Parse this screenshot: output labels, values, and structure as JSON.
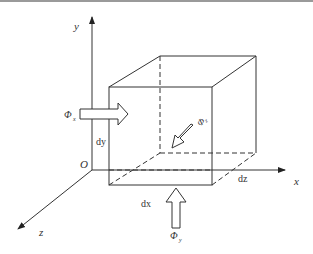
{
  "diagram": {
    "axes": {
      "x_label": "x",
      "y_label": "y",
      "z_label": "z",
      "origin_label": "O"
    },
    "dimensions": {
      "dx": "dx",
      "dy": "dy",
      "dz": "dz"
    },
    "fluxes": {
      "phi_x": {
        "symbol": "Φ",
        "subscript": "x"
      },
      "phi_y": {
        "symbol": "Φ",
        "subscript": "y"
      },
      "phi_z": {
        "symbol": "Φ",
        "subscript": "z"
      }
    },
    "colors": {
      "line": "#333333",
      "background": "#ffffff"
    }
  }
}
